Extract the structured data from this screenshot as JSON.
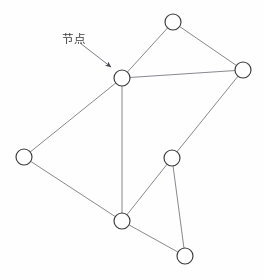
{
  "figure": {
    "kind": "network-graph-diagram",
    "background_color": "#fefefe",
    "width": 264,
    "height": 280,
    "top_cutoff_artifact_text": "— —— — ——— ——",
    "annotation": {
      "label": "节点",
      "label_x": 62,
      "label_y": 30,
      "leader_from_x": 80,
      "leader_from_y": 43,
      "leader_to_x": 111,
      "leader_to_y": 67,
      "arrowhead": "solid-triangle"
    },
    "style": {
      "node_stroke": "#3a3a3a",
      "node_fill": "#ffffff",
      "node_radius": 8,
      "node_stroke_width": 1.15,
      "edge_stroke": "#7a7a82",
      "edge_stroke_width": 0.9,
      "annotation_stroke": "#6e6e76",
      "annotation_stroke_width": 0.9
    },
    "nodes": [
      {
        "id": "n-top",
        "name": "node-top",
        "cx": 173,
        "cy": 22
      },
      {
        "id": "n-right",
        "name": "node-right",
        "cx": 243,
        "cy": 70
      },
      {
        "id": "n-center",
        "name": "node-center",
        "cx": 122,
        "cy": 78
      },
      {
        "id": "n-left",
        "name": "node-left",
        "cx": 24,
        "cy": 157
      },
      {
        "id": "n-mid-right",
        "name": "node-mid-right",
        "cx": 172,
        "cy": 158
      },
      {
        "id": "n-bottom-left",
        "name": "node-bottom-left",
        "cx": 122,
        "cy": 221
      },
      {
        "id": "n-bottom-right",
        "name": "node-bottom-right",
        "cx": 185,
        "cy": 256
      }
    ],
    "edges": [
      {
        "id": "e1",
        "name": "edge-center-top",
        "from": "n-center",
        "to": "n-top"
      },
      {
        "id": "e2",
        "name": "edge-top-right",
        "from": "n-top",
        "to": "n-right"
      },
      {
        "id": "e3",
        "name": "edge-center-right",
        "from": "n-center",
        "to": "n-right"
      },
      {
        "id": "e4",
        "name": "edge-center-left",
        "from": "n-center",
        "to": "n-left"
      },
      {
        "id": "e5",
        "name": "edge-center-bottom-left",
        "from": "n-center",
        "to": "n-bottom-left"
      },
      {
        "id": "e6",
        "name": "edge-left-bottom-left",
        "from": "n-left",
        "to": "n-bottom-left"
      },
      {
        "id": "e7",
        "name": "edge-right-mid-right",
        "from": "n-right",
        "to": "n-mid-right"
      },
      {
        "id": "e8",
        "name": "edge-mid-right-bottom-left",
        "from": "n-mid-right",
        "to": "n-bottom-left"
      },
      {
        "id": "e9",
        "name": "edge-mid-right-bottom-right",
        "from": "n-mid-right",
        "to": "n-bottom-right"
      },
      {
        "id": "e10",
        "name": "edge-bottom-left-bottom-right",
        "from": "n-bottom-left",
        "to": "n-bottom-right"
      }
    ]
  }
}
